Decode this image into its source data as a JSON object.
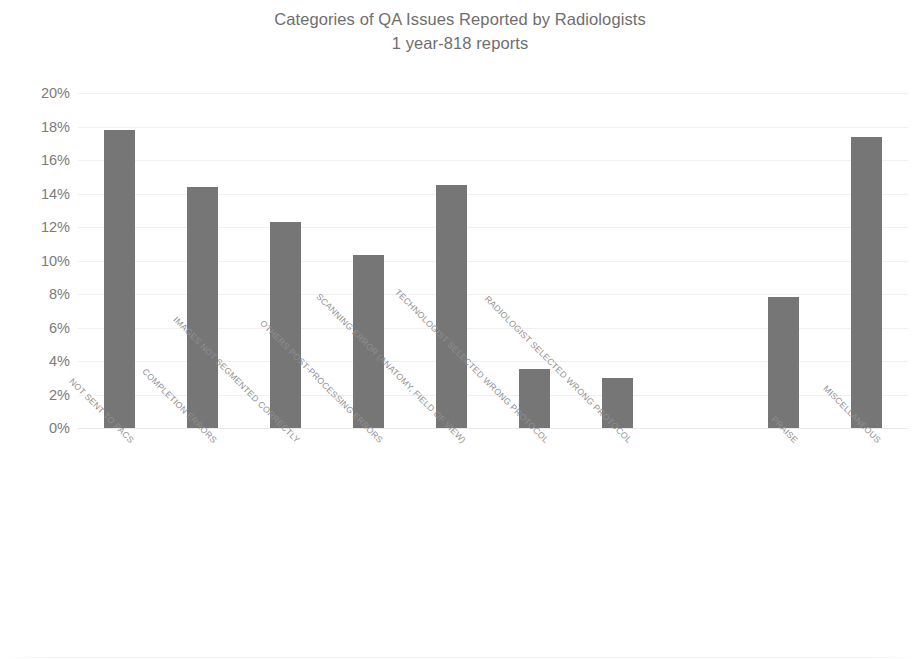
{
  "chart_data": {
    "type": "bar",
    "title": "Categories of QA Issues Reported by Radiologists",
    "subtitle": "1 year-818 reports",
    "xlabel": "",
    "ylabel": "",
    "ylim": [
      0,
      20
    ],
    "ytick_step": 2,
    "ytick_labels": [
      "20%",
      "18%",
      "16%",
      "14%",
      "12%",
      "10%",
      "8%",
      "6%",
      "4%",
      "2%",
      "0%"
    ],
    "ytick_values": [
      20,
      18,
      16,
      14,
      12,
      10,
      8,
      6,
      4,
      2,
      0
    ],
    "grid": "horizontal",
    "legend": "none",
    "value_suffix": "%",
    "bar_color": "#767676",
    "categories": [
      "NOT SENT TO PACS",
      "COMPLETION ERRORS",
      "IMAGES NOT SEGMENTED CORRECTLY",
      "OTHERS POST-PROCESSING ERRORS",
      "SCANNING ERROR (ANATOMY, FIELD OF VIEW)",
      "TECHNOLOGIST SELECTED WRONG PROTOCOL",
      "RADIOLOGIST SELECTED WRONG PROTOCOL",
      "PRAISE",
      "MISCELLANEOUS"
    ],
    "values": [
      17.8,
      14.4,
      12.3,
      10.3,
      14.5,
      3.5,
      3.0,
      7.8,
      17.4
    ],
    "slot_positions": [
      0,
      1,
      2,
      3,
      4,
      5,
      6,
      8,
      9
    ],
    "slot_count": 10
  },
  "colors": {
    "bar": "#767676",
    "text": "#6e6e6e",
    "axis_text": "#7b7b7b",
    "tick_label": "#8f8f8f",
    "gridline": "#f0f0f0",
    "background": "#ffffff"
  }
}
